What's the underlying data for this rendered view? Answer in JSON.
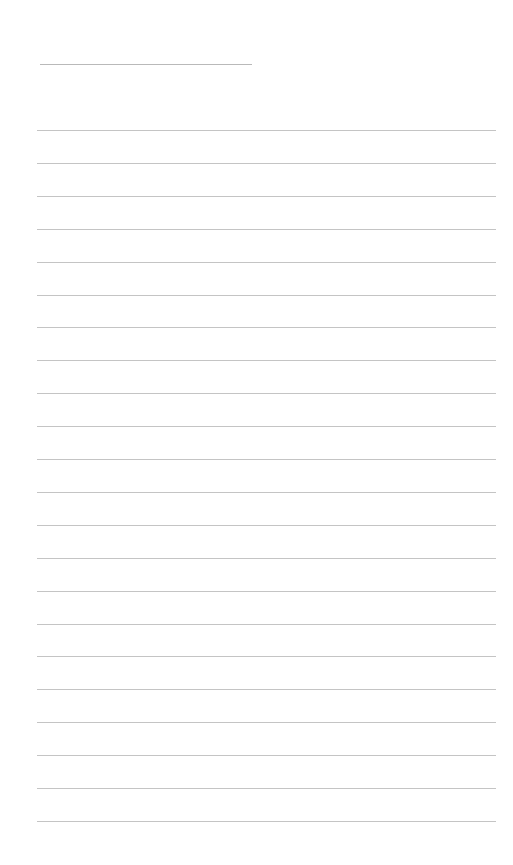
{
  "page": {
    "type": "blank lined sheet",
    "background_color": "#ffffff",
    "line_color": "#c4c4c4",
    "title_line": {
      "x": 40,
      "y": 64,
      "width": 212
    },
    "ruled_lines": {
      "count": 22,
      "x": 37,
      "width": 459,
      "first_y": 130,
      "spacing": 32.9
    }
  }
}
